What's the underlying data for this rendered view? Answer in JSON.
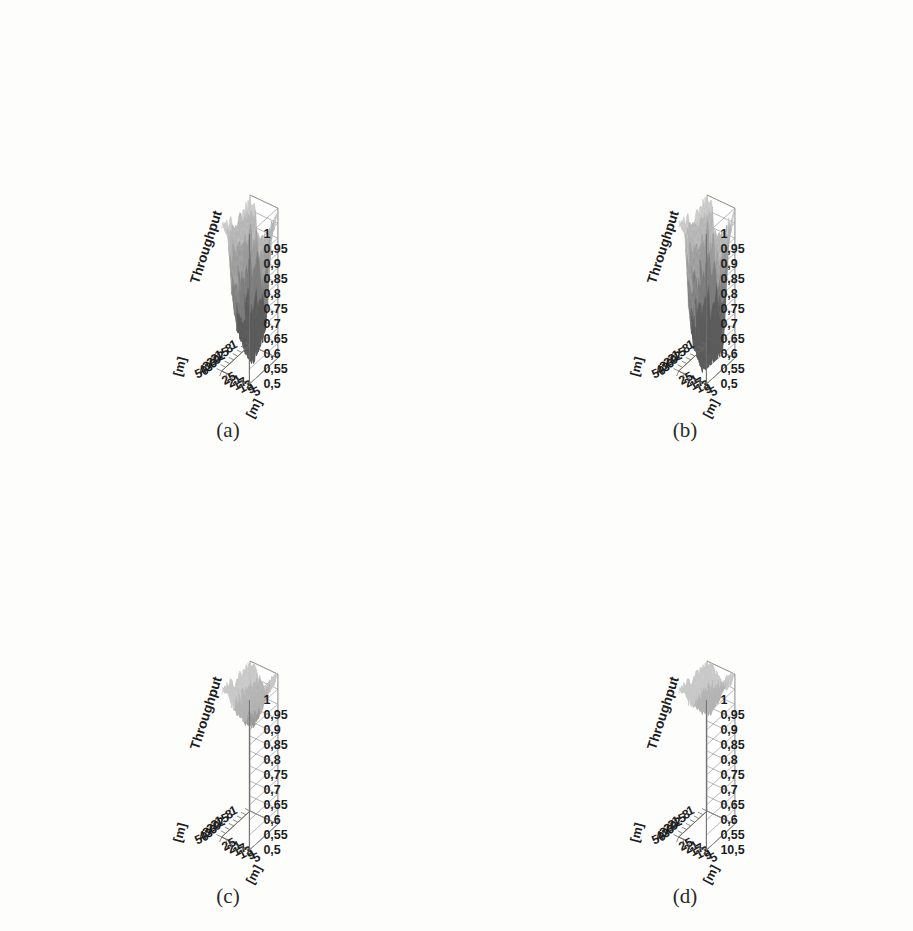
{
  "figure": {
    "panels": [
      {
        "id": "a",
        "caption": "(a)",
        "z_axis_label": "Throughput",
        "y_axis_label": "[m]",
        "x_axis_label": "[m]",
        "z_ticks": [
          "1",
          "0,95",
          "0,9",
          "0,85",
          "0,8",
          "0,75",
          "0,7",
          "0,65",
          "0,6",
          "0,55",
          "0,5"
        ],
        "y_ticks": [
          "1",
          "8",
          "15",
          "22",
          "29",
          "36",
          "43",
          "50"
        ],
        "x_ticks": [
          "25",
          "21",
          "17",
          "13",
          "9",
          "5"
        ]
      },
      {
        "id": "b",
        "caption": "(b)",
        "z_axis_label": "Throughput",
        "y_axis_label": "[m]",
        "x_axis_label": "[m]",
        "z_ticks": [
          "1",
          "0,95",
          "0,9",
          "0,85",
          "0,8",
          "0,75",
          "0,7",
          "0,65",
          "0,6",
          "0,55",
          "0,5"
        ],
        "y_ticks": [
          "1",
          "8",
          "15",
          "22",
          "29",
          "36",
          "43",
          "50"
        ],
        "x_ticks": [
          "25",
          "21",
          "17",
          "13",
          "9",
          "5"
        ]
      },
      {
        "id": "c",
        "caption": "(c)",
        "z_axis_label": "Throughput",
        "y_axis_label": "[m]",
        "x_axis_label": "[m]",
        "z_ticks": [
          "1",
          "0,95",
          "0,9",
          "0,85",
          "0,8",
          "0,75",
          "0,7",
          "0,65",
          "0,6",
          "0,55",
          "0,5"
        ],
        "y_ticks": [
          "1",
          "8",
          "15",
          "22",
          "29",
          "36",
          "43",
          "50"
        ],
        "x_ticks": [
          "25",
          "21",
          "17",
          "13",
          "9",
          "5"
        ]
      },
      {
        "id": "d",
        "caption": "(d)",
        "z_axis_label": "Throughput",
        "y_axis_label": "[m]",
        "x_axis_label": "[m]",
        "z_ticks": [
          "1",
          "0,95",
          "0,9",
          "0,85",
          "0,8",
          "0,75",
          "0,7",
          "0,65",
          "0,6",
          "0,55",
          "10,5"
        ],
        "y_ticks": [
          "1",
          "8",
          "15",
          "22",
          "29",
          "36",
          "43",
          "50"
        ],
        "x_ticks": [
          "25",
          "21",
          "17",
          "13",
          "9",
          "5"
        ]
      }
    ]
  },
  "palette": {
    "background": "#fdfdfc",
    "band_lightest": "#c9c9c9",
    "band_light": "#b4b4b4",
    "band_mid": "#9b9b9b",
    "band_dark": "#7d7d7d",
    "band_darkest": "#5c5c5c",
    "wall": "#ffffff",
    "gridline": "#9a9a9a",
    "axis": "#6f6f6f",
    "text": "#1d1d1d"
  },
  "chart_data": [
    {
      "type": "surface",
      "panel": "a",
      "title": "(a)",
      "xlabel": "[m]",
      "ylabel": "[m]",
      "zlabel": "Throughput",
      "zlim": [
        0.5,
        1.0
      ],
      "x": [
        5,
        9,
        13,
        17,
        21,
        25
      ],
      "y": [
        1,
        8,
        15,
        22,
        29,
        36,
        43,
        50
      ],
      "grid": true,
      "legend": "none",
      "z": [
        [
          0.98,
          0.95,
          0.7,
          0.6,
          0.93,
          0.97
        ],
        [
          0.97,
          0.92,
          0.62,
          0.56,
          0.88,
          0.96
        ],
        [
          0.96,
          0.88,
          0.58,
          0.54,
          0.84,
          0.95
        ],
        [
          0.95,
          0.84,
          0.55,
          0.52,
          0.8,
          0.94
        ],
        [
          0.96,
          0.86,
          0.57,
          0.53,
          0.82,
          0.95
        ],
        [
          0.97,
          0.9,
          0.61,
          0.57,
          0.87,
          0.96
        ],
        [
          0.98,
          0.93,
          0.66,
          0.62,
          0.91,
          0.97
        ],
        [
          0.99,
          0.96,
          0.74,
          0.69,
          0.94,
          0.98
        ]
      ]
    },
    {
      "type": "surface",
      "panel": "b",
      "title": "(b)",
      "xlabel": "[m]",
      "ylabel": "[m]",
      "zlabel": "Throughput",
      "zlim": [
        0.5,
        1.0
      ],
      "x": [
        5,
        9,
        13,
        17,
        21,
        25
      ],
      "y": [
        1,
        8,
        15,
        22,
        29,
        36,
        43,
        50
      ],
      "grid": true,
      "legend": "none",
      "z": [
        [
          0.99,
          0.96,
          0.62,
          0.53,
          0.9,
          0.98
        ],
        [
          0.98,
          0.93,
          0.56,
          0.51,
          0.84,
          0.97
        ],
        [
          0.97,
          0.88,
          0.53,
          0.5,
          0.78,
          0.96
        ],
        [
          0.96,
          0.82,
          0.51,
          0.5,
          0.72,
          0.95
        ],
        [
          0.97,
          0.85,
          0.52,
          0.5,
          0.76,
          0.96
        ],
        [
          0.98,
          0.9,
          0.55,
          0.51,
          0.82,
          0.97
        ],
        [
          0.99,
          0.94,
          0.6,
          0.55,
          0.88,
          0.98
        ],
        [
          0.99,
          0.97,
          0.68,
          0.62,
          0.93,
          0.99
        ]
      ]
    },
    {
      "type": "surface",
      "panel": "c",
      "title": "(c)",
      "xlabel": "[m]",
      "ylabel": "[m]",
      "zlabel": "Throughput",
      "zlim": [
        0.5,
        1.0
      ],
      "x": [
        5,
        9,
        13,
        17,
        21,
        25
      ],
      "y": [
        1,
        8,
        15,
        22,
        29,
        36,
        43,
        50
      ],
      "grid": true,
      "legend": "none",
      "z": [
        [
          0.99,
          0.98,
          0.94,
          0.91,
          0.97,
          0.99
        ],
        [
          0.99,
          0.97,
          0.92,
          0.89,
          0.96,
          0.99
        ],
        [
          0.98,
          0.96,
          0.9,
          0.87,
          0.95,
          0.98
        ],
        [
          0.98,
          0.95,
          0.88,
          0.86,
          0.94,
          0.98
        ],
        [
          0.98,
          0.96,
          0.89,
          0.87,
          0.95,
          0.98
        ],
        [
          0.99,
          0.97,
          0.91,
          0.89,
          0.96,
          0.99
        ],
        [
          0.99,
          0.98,
          0.93,
          0.92,
          0.97,
          0.99
        ],
        [
          0.99,
          0.99,
          0.96,
          0.95,
          0.98,
          0.99
        ]
      ]
    },
    {
      "type": "surface",
      "panel": "d",
      "title": "(d)",
      "xlabel": "[m]",
      "ylabel": "[m]",
      "zlabel": "Throughput",
      "zlim": [
        0.5,
        1.0
      ],
      "x": [
        5,
        9,
        13,
        17,
        21,
        25
      ],
      "y": [
        1,
        8,
        15,
        22,
        29,
        36,
        43,
        50
      ],
      "grid": true,
      "legend": "none",
      "z": [
        [
          0.99,
          0.99,
          0.96,
          0.94,
          0.98,
          0.99
        ],
        [
          0.99,
          0.98,
          0.95,
          0.92,
          0.97,
          0.99
        ],
        [
          0.99,
          0.98,
          0.93,
          0.91,
          0.97,
          0.99
        ],
        [
          0.99,
          0.97,
          0.92,
          0.9,
          0.96,
          0.99
        ],
        [
          0.99,
          0.97,
          0.93,
          0.91,
          0.97,
          0.99
        ],
        [
          0.99,
          0.98,
          0.94,
          0.93,
          0.97,
          0.99
        ],
        [
          0.99,
          0.99,
          0.96,
          0.95,
          0.98,
          0.99
        ],
        [
          0.99,
          0.99,
          0.97,
          0.97,
          0.99,
          0.99
        ]
      ]
    }
  ]
}
